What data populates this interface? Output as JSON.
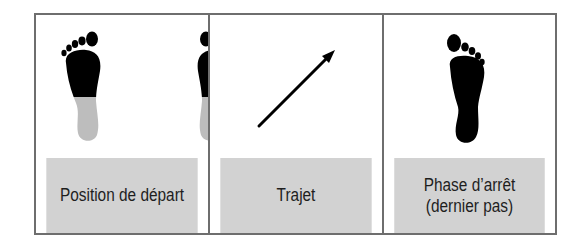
{
  "panels": [
    {
      "id": "start-position",
      "caption": [
        "Position de départ"
      ],
      "illustration": "two-feet-side-by-side-toes-black-heels-gray"
    },
    {
      "id": "path",
      "caption": [
        "Trajet"
      ],
      "illustration": "diagonal-arrow-up-right"
    },
    {
      "id": "stop-phase",
      "caption": [
        "Phase d’arrêt",
        "(dernier pas)"
      ],
      "illustration": "single-black-footprint"
    }
  ],
  "colors": {
    "border": "#6e6e6e",
    "caption_background": "#d2d2d2",
    "foot_black": "#000000",
    "foot_gray": "#bdbdbd",
    "text": "#1e1e1e"
  }
}
